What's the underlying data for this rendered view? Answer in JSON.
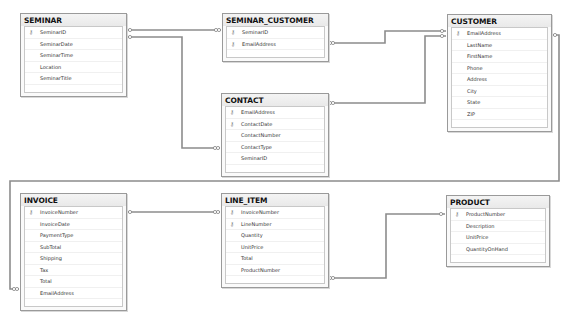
{
  "diagram": {
    "tables": [
      {
        "id": "seminar",
        "name": "SEMINAR",
        "columns": [
          {
            "name": "SeminarID",
            "key": true
          },
          {
            "name": "SeminarDate",
            "key": false
          },
          {
            "name": "SeminarTime",
            "key": false
          },
          {
            "name": "Location",
            "key": false
          },
          {
            "name": "SeminarTitle",
            "key": false
          }
        ]
      },
      {
        "id": "seminar_customer",
        "name": "SEMINAR_CUSTOMER",
        "columns": [
          {
            "name": "SeminarID",
            "key": true
          },
          {
            "name": "EmailAddress",
            "key": true
          }
        ]
      },
      {
        "id": "contact",
        "name": "CONTACT",
        "columns": [
          {
            "name": "EmailAddress",
            "key": true
          },
          {
            "name": "ContactDate",
            "key": true
          },
          {
            "name": "ContactNumber",
            "key": false
          },
          {
            "name": "ContactType",
            "key": false
          },
          {
            "name": "SeminarID",
            "key": false
          }
        ]
      },
      {
        "id": "customer",
        "name": "CUSTOMER",
        "columns": [
          {
            "name": "EmailAddress",
            "key": true
          },
          {
            "name": "LastName",
            "key": false
          },
          {
            "name": "FirstName",
            "key": false
          },
          {
            "name": "Phone",
            "key": false
          },
          {
            "name": "Address",
            "key": false
          },
          {
            "name": "City",
            "key": false
          },
          {
            "name": "State",
            "key": false
          },
          {
            "name": "ZIP",
            "key": false
          }
        ]
      },
      {
        "id": "invoice",
        "name": "INVOICE",
        "columns": [
          {
            "name": "InvoiceNumber",
            "key": true
          },
          {
            "name": "InvoiceDate",
            "key": false
          },
          {
            "name": "PaymentType",
            "key": false
          },
          {
            "name": "SubTotal",
            "key": false
          },
          {
            "name": "Shipping",
            "key": false
          },
          {
            "name": "Tax",
            "key": false
          },
          {
            "name": "Total",
            "key": false
          },
          {
            "name": "EmailAddress",
            "key": false
          }
        ]
      },
      {
        "id": "line_item",
        "name": "LINE_ITEM",
        "columns": [
          {
            "name": "InvoiceNumber",
            "key": true
          },
          {
            "name": "LineNumber",
            "key": true
          },
          {
            "name": "Quantity",
            "key": false
          },
          {
            "name": "UnitPrice",
            "key": false
          },
          {
            "name": "Total",
            "key": false
          },
          {
            "name": "ProductNumber",
            "key": false
          }
        ]
      },
      {
        "id": "product",
        "name": "PRODUCT",
        "columns": [
          {
            "name": "ProductNumber",
            "key": true
          },
          {
            "name": "Description",
            "key": false
          },
          {
            "name": "UnitPrice",
            "key": false
          },
          {
            "name": "QuantityOnHand",
            "key": false
          }
        ]
      }
    ],
    "relationships": [
      {
        "from": "SEMINAR",
        "to": "SEMINAR_CUSTOMER",
        "one_end": "key",
        "many_end": "infinity"
      },
      {
        "from": "SEMINAR",
        "to": "CONTACT",
        "one_end": "key",
        "many_end": "infinity"
      },
      {
        "from": "CUSTOMER",
        "to": "SEMINAR_CUSTOMER",
        "one_end": "key",
        "many_end": "infinity"
      },
      {
        "from": "CUSTOMER",
        "to": "CONTACT",
        "one_end": "key",
        "many_end": "infinity"
      },
      {
        "from": "CUSTOMER",
        "to": "INVOICE",
        "one_end": "key",
        "many_end": "infinity"
      },
      {
        "from": "INVOICE",
        "to": "LINE_ITEM",
        "one_end": "key",
        "many_end": "infinity"
      },
      {
        "from": "PRODUCT",
        "to": "LINE_ITEM",
        "one_end": "key",
        "many_end": "infinity"
      }
    ],
    "icons": {
      "primary_key": "key-icon",
      "one_end": "key-icon",
      "many_end": "infinity-icon"
    }
  }
}
